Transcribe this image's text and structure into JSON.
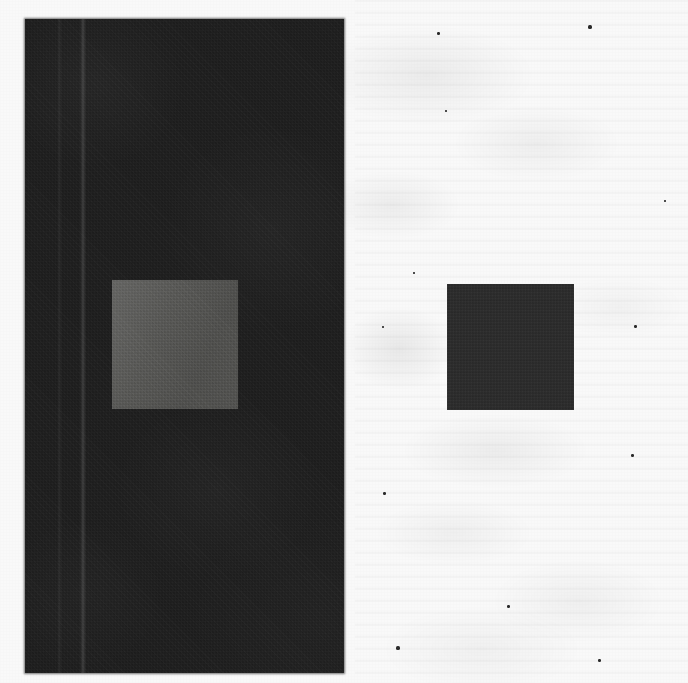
{
  "figure": {
    "medium": "scanned halftone print",
    "canvas": {
      "width_px": 688,
      "height_px": 683,
      "background_color": "#fdfdfd"
    },
    "colors": {
      "paper_white": "#fdfdfd",
      "dark_surround": "#161616",
      "light_patch": "#4a4a47",
      "dark_patch": "#232323",
      "speck": "#2a2a2a"
    },
    "panels": [
      {
        "id": "dark-surround-panel",
        "name": "left-panel",
        "surround": "black",
        "x": 25,
        "y": 19,
        "width": 319,
        "height": 654,
        "color": "#161616",
        "patch": {
          "id": "light-patch",
          "name": "gray-patch-on-black",
          "x": 112,
          "y": 280,
          "width": 126,
          "height": 129,
          "color": "#4a4a47",
          "appearance": "appears lighter"
        },
        "streak": {
          "x": 80,
          "width": 6,
          "description": "vertical scan streak"
        },
        "streak2": {
          "x": 57,
          "width": 5,
          "description": "faint secondary streak"
        }
      },
      {
        "id": "white-surround-panel",
        "name": "right-panel",
        "surround": "white",
        "x": 355,
        "y": 0,
        "width": 333,
        "height": 683,
        "color": "#fdfdfd",
        "patch": {
          "id": "dark-patch",
          "name": "gray-patch-on-white",
          "x": 447,
          "y": 284,
          "width": 127,
          "height": 126,
          "color": "#232323",
          "appearance": "appears darker"
        }
      }
    ],
    "specks": [
      {
        "x": 588,
        "y": 25,
        "w": 4,
        "h": 4
      },
      {
        "x": 396,
        "y": 646,
        "w": 4,
        "h": 4
      },
      {
        "x": 437,
        "y": 32,
        "w": 3,
        "h": 3
      },
      {
        "x": 634,
        "y": 325,
        "w": 3,
        "h": 3
      },
      {
        "x": 631,
        "y": 454,
        "w": 3,
        "h": 3
      },
      {
        "x": 383,
        "y": 492,
        "w": 3,
        "h": 3
      },
      {
        "x": 382,
        "y": 326,
        "w": 2,
        "h": 2
      },
      {
        "x": 507,
        "y": 605,
        "w": 3,
        "h": 3
      },
      {
        "x": 413,
        "y": 272,
        "w": 2,
        "h": 2
      },
      {
        "x": 598,
        "y": 659,
        "w": 3,
        "h": 3
      },
      {
        "x": 664,
        "y": 200,
        "w": 2,
        "h": 2
      },
      {
        "x": 445,
        "y": 110,
        "w": 2,
        "h": 2
      }
    ]
  }
}
